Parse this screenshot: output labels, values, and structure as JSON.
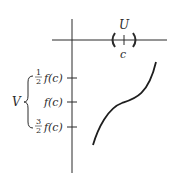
{
  "diagram": {
    "type": "function-neighborhood-illustration",
    "x_axis": {
      "labels": {
        "interval": "U",
        "point": "c"
      }
    },
    "y_axis": {
      "ticks": [
        {
          "coef_num": "1",
          "coef_den": "2",
          "label": "f(c)"
        },
        {
          "coef_num": "",
          "coef_den": "",
          "label": "f(c)"
        },
        {
          "coef_num": "3",
          "coef_den": "2",
          "label": "f(c)"
        }
      ],
      "brace_label": "V"
    },
    "colors": {
      "ink": "#2a2a2a",
      "background": "#ffffff"
    }
  }
}
